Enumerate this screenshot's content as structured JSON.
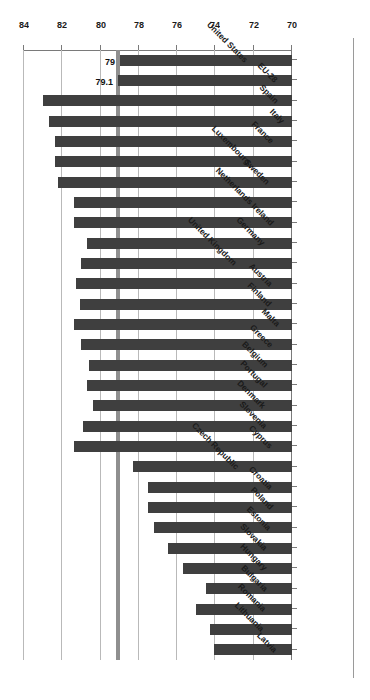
{
  "chart_data": {
    "type": "bar",
    "orientation": "horizontal",
    "title": "",
    "xlabel": "Life Expectancy",
    "ylabel": "",
    "xlim": [
      84,
      70
    ],
    "xticks": [
      "84",
      "82",
      "80",
      "78",
      "76",
      "74",
      "72",
      "70"
    ],
    "xtick_values": [
      84,
      82,
      80,
      78,
      76,
      74,
      72,
      70
    ],
    "grid": true,
    "legend": "none",
    "bar_color": "#3f3f3f",
    "categories": [
      "Latvia",
      "Lithuania",
      "Romania",
      "Bulgaria",
      "Hungary",
      "Slovakia",
      "Estonia",
      "Poland",
      "Croatia",
      "Czech Republic",
      "Cyprus",
      "Slovenia",
      "Denmark",
      "Portugal",
      "Belgium",
      "Greece",
      "Malta",
      "Finland",
      "Austria",
      "United Kingdom",
      "Germany",
      "Ireland",
      "Netherlands",
      "Sweden",
      "Luxembourg",
      "France",
      "Italy",
      "Spain",
      "EU-28",
      "United States"
    ],
    "values": [
      74.1,
      74.3,
      75.0,
      74.5,
      75.7,
      76.5,
      77.2,
      77.5,
      77.5,
      78.3,
      81.4,
      80.9,
      80.4,
      80.7,
      80.6,
      81.0,
      81.4,
      81.1,
      81.3,
      81.0,
      80.7,
      81.4,
      81.4,
      82.2,
      82.4,
      82.4,
      82.7,
      83.0,
      79.1,
      79.0
    ],
    "data_labels": [
      {
        "category": "EU-28",
        "label": "79.1"
      },
      {
        "category": "United States",
        "label": "79"
      }
    ],
    "reference_lines": [
      79.1,
      79.0
    ]
  }
}
